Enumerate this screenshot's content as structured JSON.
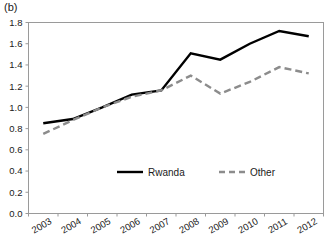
{
  "figure": {
    "panel_label": "(b)"
  },
  "chart_data": {
    "type": "line",
    "title": "",
    "xlabel": "",
    "ylabel": "",
    "categories": [
      "2003",
      "2004",
      "2005",
      "2006",
      "2007",
      "2008",
      "2009",
      "2010",
      "2011",
      "2012"
    ],
    "series": [
      {
        "name": "Rwanda",
        "style": "solid",
        "color": "#000000",
        "values": [
          0.85,
          0.89,
          1.0,
          1.12,
          1.16,
          1.51,
          1.45,
          1.6,
          1.72,
          1.67
        ]
      },
      {
        "name": "Other",
        "style": "dashed",
        "color": "#8c8c8c",
        "values": [
          0.75,
          0.88,
          1.0,
          1.1,
          1.16,
          1.3,
          1.13,
          1.24,
          1.38,
          1.32
        ]
      }
    ],
    "ylim": [
      0.0,
      1.8
    ],
    "ytick_labels": [
      "0.0",
      "0.2",
      "0.4",
      "0.6",
      "0.8",
      "1.0",
      "1.2",
      "1.4",
      "1.6",
      "1.8"
    ],
    "ytick_values": [
      0.0,
      0.2,
      0.4,
      0.6,
      0.8,
      1.0,
      1.2,
      1.4,
      1.6,
      1.8
    ],
    "grid": false,
    "legend_position": "inside-bottom-center",
    "xtick_rotation": -30
  }
}
